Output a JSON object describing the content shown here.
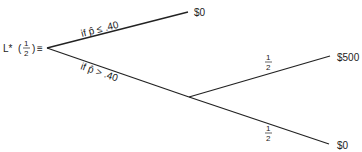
{
  "diagram": {
    "type": "decision-tree",
    "root_label": {
      "prefix": "L*",
      "open_paren": "(",
      "numerator": "1",
      "denominator": "2",
      "close_paren": ")",
      "equiv": "≡"
    },
    "branches": [
      {
        "condition": "if p̂ ≤ .40",
        "outcome": "$0"
      },
      {
        "condition": "if p̂ > .40",
        "chance_node": {
          "outcomes": [
            {
              "probability_num": "1",
              "probability_den": "2",
              "outcome": "$500"
            },
            {
              "probability_num": "1",
              "probability_den": "2",
              "outcome": "$0"
            }
          ]
        }
      }
    ]
  }
}
